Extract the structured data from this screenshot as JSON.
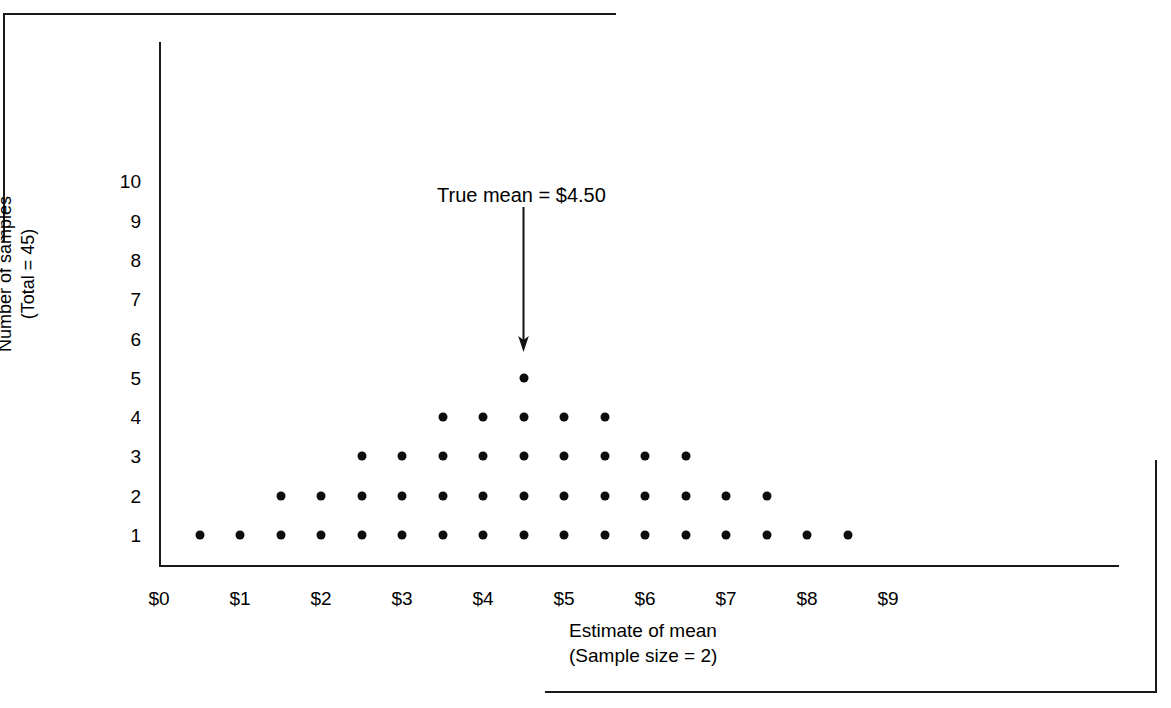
{
  "chart_data": {
    "type": "scatter",
    "title": "",
    "xlabel": "Estimate of mean",
    "xlabel_line2": "(Sample size = 2)",
    "ylabel": "Number of samples",
    "ylabel_line2": "(Total = 45)",
    "x_tick_labels": [
      "$0",
      "$1",
      "$2",
      "$3",
      "$4",
      "$5",
      "$6",
      "$7",
      "$8",
      "$9"
    ],
    "x_tick_values": [
      0,
      1,
      2,
      3,
      4,
      5,
      6,
      7,
      8,
      9
    ],
    "y_tick_labels": [
      "1",
      "2",
      "3",
      "4",
      "5",
      "6",
      "7",
      "8",
      "9",
      "10"
    ],
    "y_tick_values": [
      1,
      2,
      3,
      4,
      5,
      6,
      7,
      8,
      9,
      10
    ],
    "xlim": [
      0,
      9.85
    ],
    "ylim": [
      0,
      11
    ],
    "grid": false,
    "legend": "none",
    "dot_color": "#0d0d0d",
    "axis_color": "#1a1a1a",
    "total_samples": 45,
    "sample_size": 2,
    "categories": [
      0.5,
      1.0,
      1.5,
      2.0,
      2.5,
      3.0,
      3.5,
      4.0,
      4.5,
      5.0,
      5.5,
      6.0,
      6.5,
      7.0,
      7.5,
      8.0,
      8.5
    ],
    "values": [
      1,
      1,
      2,
      2,
      3,
      3,
      4,
      4,
      5,
      4,
      4,
      3,
      3,
      2,
      2,
      1,
      1
    ],
    "stacks": [
      {
        "x": 0.5,
        "count": 1
      },
      {
        "x": 1.0,
        "count": 1
      },
      {
        "x": 1.5,
        "count": 2
      },
      {
        "x": 2.0,
        "count": 2
      },
      {
        "x": 2.5,
        "count": 3
      },
      {
        "x": 3.0,
        "count": 3
      },
      {
        "x": 3.5,
        "count": 4
      },
      {
        "x": 4.0,
        "count": 4
      },
      {
        "x": 4.5,
        "count": 5
      },
      {
        "x": 5.0,
        "count": 4
      },
      {
        "x": 5.5,
        "count": 4
      },
      {
        "x": 6.0,
        "count": 3
      },
      {
        "x": 6.5,
        "count": 3
      },
      {
        "x": 7.0,
        "count": 2
      },
      {
        "x": 7.5,
        "count": 2
      },
      {
        "x": 8.0,
        "count": 1
      },
      {
        "x": 8.5,
        "count": 1
      }
    ],
    "annotations": [
      {
        "name": "true-mean",
        "text": "True mean  =  $4.50",
        "value": 4.5,
        "arrow": "down",
        "points_to_x": 4.5
      }
    ]
  },
  "annotation": {
    "true_mean_label": "True mean  =  $4.50"
  },
  "axes": {
    "x_title_line1": "Estimate of mean",
    "x_title_line2": "(Sample size = 2)",
    "y_title_line1": "Number of samples",
    "y_title_line2": "(Total = 45)"
  }
}
